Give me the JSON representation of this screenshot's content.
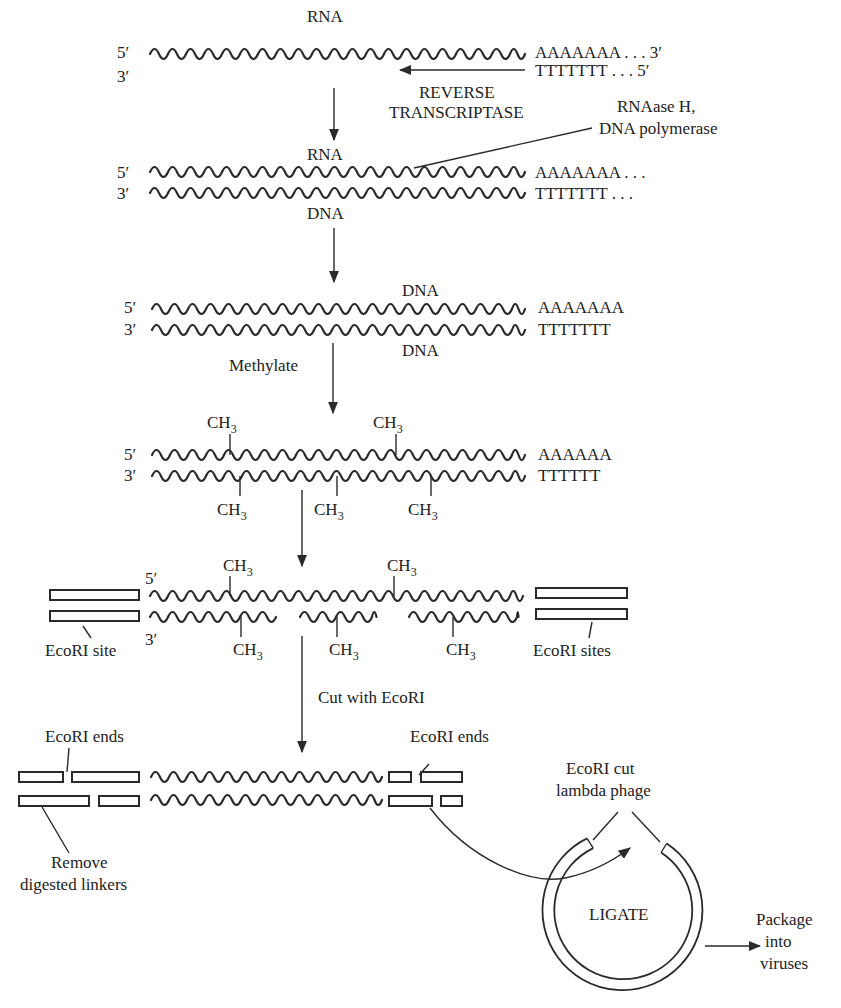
{
  "figure": {
    "ink_color": "#2a2a2a",
    "background": "#ffffff"
  },
  "step1": {
    "strand_label": "RNA",
    "five_prime": "5′",
    "three_prime": "3′",
    "polyA": "AAAAAAA . . . 3′",
    "polyT": "TTTTTTT . . . 5′",
    "enzyme_line1": "REVERSE",
    "enzyme_line2": "TRANSCRIPTASE"
  },
  "step2": {
    "top_label": "RNA",
    "bottom_label": "DNA",
    "five_prime": "5′",
    "three_prime": "3′",
    "polyA": "AAAAAAA . . .",
    "polyT": "TTTTTTT . . .",
    "enzyme_line1": "RNAase H,",
    "enzyme_line2": "DNA polymerase"
  },
  "step3": {
    "top_label": "DNA",
    "bottom_label": "DNA",
    "five_prime": "5′",
    "three_prime": "3′",
    "polyA": "AAAAAAA",
    "polyT": "TTTTTTT",
    "action": "Methylate"
  },
  "step4": {
    "five_prime": "5′",
    "three_prime": "3′",
    "polyA": "AAAAAA",
    "polyT": "TTTTTT",
    "methyl": "CH",
    "methyl_sub": "3"
  },
  "step5": {
    "five_prime": "5′",
    "three_prime": "3′",
    "methyl": "CH",
    "methyl_sub": "3",
    "left_site_label": "EcoRI site",
    "right_site_label": "EcoRI sites",
    "action": "Cut with EcoRI"
  },
  "step6": {
    "left_ends_label": "EcoRI ends",
    "right_ends_label": "EcoRI ends",
    "remove_line1": "Remove",
    "remove_line2": "digested linkers"
  },
  "phage": {
    "label_line1": "EcoRI cut",
    "label_line2": "lambda phage",
    "center_label": "LIGATE",
    "output_line1": "Package",
    "output_line2": "into",
    "output_line3": "viruses"
  }
}
